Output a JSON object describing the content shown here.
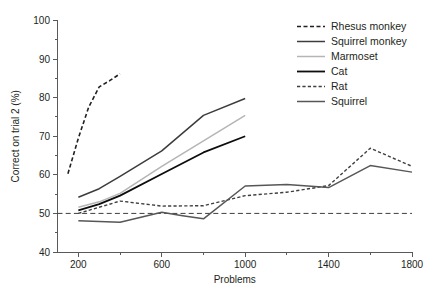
{
  "chart_data": {
    "type": "line",
    "title": "",
    "xlabel": "Problems",
    "ylabel": "Correct on trial 2 (%)",
    "xlim": [
      100,
      1800
    ],
    "ylim": [
      40,
      100
    ],
    "x_ticks_major": [
      200,
      600,
      1000,
      1400,
      1800
    ],
    "x_ticks_major_labels": [
      "200",
      "600",
      "1000",
      "1400",
      "1800"
    ],
    "x_ticks_minor": [
      400,
      800,
      1200,
      1600
    ],
    "y_ticks_major": [
      40,
      50,
      60,
      70,
      80,
      90,
      100
    ],
    "y_ticks_major_labels": [
      "40",
      "50",
      "60",
      "70",
      "80",
      "90",
      "100"
    ],
    "y_ticks_minor": [
      45,
      55,
      65,
      75,
      85,
      95
    ],
    "grid": false,
    "legend_position": "top-right",
    "chance_line": {
      "name": "chance-level",
      "value": 50,
      "style": "dashed",
      "color": "#3f3f3f",
      "x_from": 100,
      "x_to": 1800
    },
    "series": [
      {
        "name": "Rhesus monkey",
        "style": "dashed",
        "color": "#231f20",
        "width": 1.6,
        "dash": "4,2.5",
        "x": [
          150,
          200,
          250,
          300,
          350,
          400
        ],
        "y": [
          60.3,
          69.5,
          77.6,
          82.8,
          84.4,
          86.2
        ]
      },
      {
        "name": "Squirrel monkey",
        "style": "solid",
        "color": "#3c3c3c",
        "width": 1.5,
        "dash": "",
        "x": [
          200,
          300,
          400,
          600,
          800,
          1000
        ],
        "y": [
          54.2,
          56.4,
          59.6,
          66.2,
          75.4,
          79.8
        ]
      },
      {
        "name": "Marmoset",
        "style": "solid",
        "color": "#b5b5b5",
        "width": 1.5,
        "dash": "",
        "x": [
          200,
          300,
          400,
          600,
          800,
          1000
        ],
        "y": [
          51.6,
          53.0,
          55.2,
          62.2,
          68.8,
          75.4
        ]
      },
      {
        "name": "Cat",
        "style": "solid",
        "color": "#0d0d0d",
        "width": 1.8,
        "dash": "",
        "x": [
          200,
          300,
          400,
          600,
          800,
          1000
        ],
        "y": [
          50.8,
          52.4,
          54.6,
          60.2,
          65.8,
          70.0
        ]
      },
      {
        "name": "Rat",
        "style": "dashed",
        "color": "#3f3f3f",
        "width": 1.4,
        "dash": "3.2,2.2",
        "x": [
          200,
          400,
          600,
          800,
          1000,
          1200,
          1400,
          1600,
          1800
        ],
        "y": [
          50.0,
          53.2,
          51.9,
          52.0,
          54.6,
          55.5,
          57.2,
          66.9,
          62.2
        ]
      },
      {
        "name": "Squirrel",
        "style": "solid",
        "color": "#575757",
        "width": 1.5,
        "dash": "",
        "x": [
          200,
          300,
          400,
          600,
          700,
          800,
          1000,
          1200,
          1400,
          1600,
          1800
        ],
        "y": [
          48.1,
          47.9,
          47.7,
          50.3,
          49.4,
          48.6,
          57.1,
          57.5,
          56.7,
          62.4,
          60.7
        ]
      }
    ]
  },
  "legend": {
    "items": [
      {
        "label": "Rhesus monkey"
      },
      {
        "label": "Squirrel monkey"
      },
      {
        "label": "Marmoset"
      },
      {
        "label": "Cat"
      },
      {
        "label": "Rat"
      },
      {
        "label": "Squirrel"
      }
    ]
  }
}
